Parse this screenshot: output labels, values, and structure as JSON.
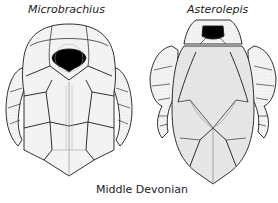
{
  "figure": {
    "specimens": [
      {
        "name": "Microbrachius",
        "view": "dorsal",
        "position": "left"
      },
      {
        "name": "Asterolepis",
        "view": "dorsal",
        "position": "right"
      }
    ],
    "caption": "Middle Devonian"
  },
  "colors": {
    "line": "#1a1a1a",
    "fill": "#f2f2f2",
    "shade": "#cfcfcf",
    "orbit": "#000000"
  }
}
